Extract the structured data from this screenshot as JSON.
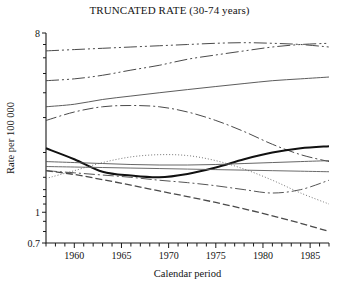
{
  "chart_data": {
    "type": "line",
    "title": "TRUNCATED RATE (30-74 years)",
    "xlabel": "Calendar period",
    "ylabel": "Rate per 100 000",
    "yscale": "log",
    "ylim": [
      0.7,
      8
    ],
    "xlim": [
      1957,
      1987
    ],
    "grid": false,
    "legend": "none",
    "ytick_labels": [
      "8",
      "1",
      "0.7"
    ],
    "ytick_values": [
      8,
      1,
      0.7
    ],
    "yminor_values": [
      7,
      6,
      5,
      4,
      3,
      2,
      1.5,
      1.3,
      1.2,
      1.1,
      0.9,
      0.8
    ],
    "xtick_labels": [
      "1960",
      "1965",
      "1970",
      "1975",
      "1980",
      "1985"
    ],
    "xtick_values": [
      1960,
      1965,
      1970,
      1975,
      1980,
      1985
    ],
    "xminor_step": 1,
    "x": [
      1957,
      1960,
      1963,
      1966,
      1969,
      1972,
      1975,
      1978,
      1981,
      1984,
      1987
    ],
    "series": [
      {
        "name": "series-1",
        "style": "dash-dot-dot",
        "color": "#4a4a4a",
        "values": [
          6.5,
          6.6,
          6.7,
          6.8,
          6.9,
          7.0,
          7.1,
          7.15,
          7.1,
          7.0,
          6.8
        ]
      },
      {
        "name": "series-2",
        "style": "dash-dot-dot",
        "color": "#4a4a4a",
        "values": [
          4.6,
          4.7,
          4.9,
          5.2,
          5.5,
          5.9,
          6.2,
          6.5,
          6.8,
          7.0,
          7.1
        ]
      },
      {
        "name": "series-3",
        "style": "solid-thin",
        "color": "#4a4a4a",
        "values": [
          3.4,
          3.5,
          3.7,
          3.85,
          4.0,
          4.15,
          4.3,
          4.45,
          4.6,
          4.7,
          4.8
        ]
      },
      {
        "name": "series-4",
        "style": "dash-dot",
        "color": "#4a4a4a",
        "values": [
          2.9,
          3.2,
          3.4,
          3.45,
          3.4,
          3.2,
          2.9,
          2.55,
          2.2,
          1.95,
          1.8
        ]
      },
      {
        "name": "series-5",
        "style": "solid-thick",
        "color": "#111111",
        "values": [
          2.1,
          1.85,
          1.6,
          1.53,
          1.5,
          1.56,
          1.68,
          1.85,
          2.0,
          2.1,
          2.15
        ]
      },
      {
        "name": "series-6",
        "style": "solid-thin",
        "color": "#555555",
        "values": [
          1.8,
          1.78,
          1.76,
          1.74,
          1.73,
          1.73,
          1.74,
          1.76,
          1.78,
          1.8,
          1.82
        ]
      },
      {
        "name": "series-7",
        "style": "dotted",
        "color": "#666666",
        "values": [
          1.48,
          1.62,
          1.78,
          1.9,
          1.95,
          1.93,
          1.82,
          1.65,
          1.45,
          1.25,
          1.1
        ]
      },
      {
        "name": "series-8",
        "style": "solid-thin",
        "color": "#5a5a5a",
        "values": [
          1.7,
          1.69,
          1.68,
          1.67,
          1.66,
          1.65,
          1.64,
          1.63,
          1.62,
          1.61,
          1.6
        ]
      },
      {
        "name": "series-9",
        "style": "dash-dot",
        "color": "#555555",
        "values": [
          1.62,
          1.58,
          1.54,
          1.5,
          1.45,
          1.41,
          1.36,
          1.3,
          1.25,
          1.3,
          1.45
        ]
      },
      {
        "name": "series-10",
        "style": "dashed",
        "color": "#4a4a4a",
        "values": [
          1.62,
          1.55,
          1.46,
          1.37,
          1.28,
          1.2,
          1.12,
          1.04,
          0.96,
          0.88,
          0.8
        ]
      }
    ]
  }
}
